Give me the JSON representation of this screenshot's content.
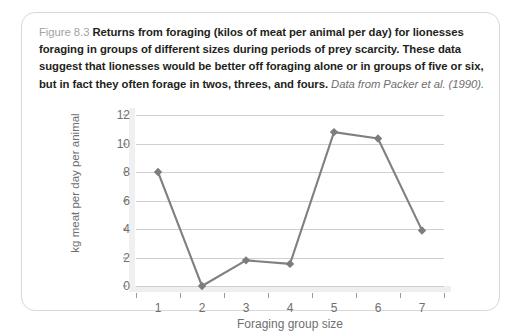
{
  "figure": {
    "label": "Figure 8.3",
    "body": "Returns from foraging (kilos of meat per animal per day) for lionesses foraging in groups of different sizes during periods of prey scarcity. These data suggest that lionesses would be better off foraging alone or in groups of five or six, but in fact they often forage in twos, threes, and fours.",
    "source": "Data from Packer et al. (1990)."
  },
  "chart_data": {
    "type": "line",
    "title": "",
    "xlabel": "Foraging group size",
    "ylabel": "kg meat per day per animal",
    "categories": [
      "1",
      "2",
      "3",
      "4",
      "5",
      "6",
      "7"
    ],
    "x": [
      1,
      2,
      3,
      4,
      5,
      6,
      7
    ],
    "values": [
      8.0,
      0.0,
      1.8,
      1.55,
      10.8,
      10.35,
      3.9
    ],
    "series": [
      {
        "name": "kg meat per day per animal",
        "values": [
          8.0,
          0.0,
          1.8,
          1.55,
          10.8,
          10.35,
          3.9
        ]
      }
    ],
    "ylim": [
      0,
      12
    ],
    "yticks": [
      "0",
      "2",
      "4",
      "6",
      "8",
      "10",
      "12"
    ],
    "ytick_values": [
      0,
      2,
      4,
      6,
      8,
      10,
      12
    ],
    "xtick_labels": [
      "1",
      "2",
      "3",
      "4",
      "5",
      "6",
      "7"
    ],
    "grid": "horizontal",
    "legend": "none",
    "marker": "diamond",
    "line_color": "#808080",
    "marker_color": "#7d7d7d",
    "grid_color": "#cfcfcf",
    "axis_text_color": "#6f6f6f"
  },
  "colors": {
    "card_border": "#d8d8d8",
    "caption_text": "#231f20",
    "caption_label": "#a3a3a3",
    "source_text": "#6e6e6e",
    "axis_band": "#efefef"
  }
}
